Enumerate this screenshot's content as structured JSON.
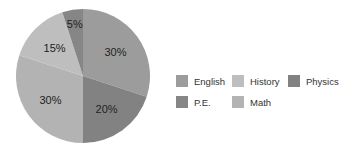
{
  "chart_data": {
    "type": "pie",
    "title": "",
    "categories": [
      "English",
      "Physics",
      "Math",
      "History",
      "P.E."
    ],
    "values": [
      30,
      20,
      30,
      15,
      5
    ],
    "labels": [
      "30%",
      "20%",
      "30%",
      "15%",
      "5%"
    ],
    "colors": [
      "#9c9c9c",
      "#828282",
      "#b3b3b3",
      "#bebebe",
      "#868686"
    ],
    "start_angle_deg": 0,
    "direction": "clockwise",
    "legend": {
      "position": "right",
      "entries": [
        {
          "label": "English",
          "color": "#9c9c9c"
        },
        {
          "label": "History",
          "color": "#bebebe"
        },
        {
          "label": "Physics",
          "color": "#828282"
        },
        {
          "label": "P.E.",
          "color": "#868686"
        },
        {
          "label": "Math",
          "color": "#b3b3b3"
        }
      ]
    }
  }
}
